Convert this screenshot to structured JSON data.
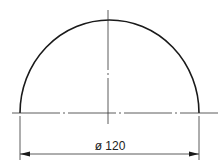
{
  "drawing": {
    "type": "semicircle-dimensioned",
    "dimension_label": "ø 120",
    "diameter_value": 120,
    "line_color": "#1a1a1a",
    "centerline_color": "#333333"
  }
}
